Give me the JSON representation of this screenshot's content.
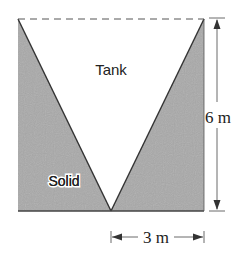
{
  "diagram": {
    "labels": {
      "tank": "Tank",
      "solid": "Solid",
      "height": "6 m",
      "half_width": "3 m"
    },
    "colors": {
      "solid_fill": "#a9a9a9",
      "line": "#333333",
      "dashed_top": "#555555",
      "background": "#ffffff"
    }
  }
}
